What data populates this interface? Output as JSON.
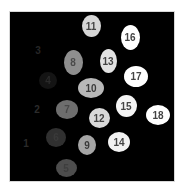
{
  "image": {
    "description": "Grayscale labeled segmentation image with 18 numbered objects on black background",
    "background": "#000000"
  },
  "objects": [
    {
      "id": "1",
      "label": "1",
      "cx": 26,
      "cy": 143,
      "w": 0,
      "h": 0,
      "fill": "#000000",
      "text_color": "#2a2a2a"
    },
    {
      "id": "2",
      "label": "2",
      "cx": 37,
      "cy": 109,
      "w": 0,
      "h": 0,
      "fill": "#000000",
      "text_color": "#2c2c2c"
    },
    {
      "id": "3",
      "label": "3",
      "cx": 38,
      "cy": 50,
      "w": 0,
      "h": 0,
      "fill": "#000000",
      "text_color": "#262626"
    },
    {
      "id": "4",
      "label": "4",
      "cx": 48,
      "cy": 80,
      "w": 18,
      "h": 17,
      "fill": "#141414",
      "text_color": "#2a2a2a"
    },
    {
      "id": "5",
      "label": "5",
      "cx": 66,
      "cy": 168,
      "w": 21,
      "h": 18,
      "fill": "#4d4d4d",
      "text_color": "#3e3e3e"
    },
    {
      "id": "6",
      "label": "6",
      "cx": 56,
      "cy": 137,
      "w": 20,
      "h": 19,
      "fill": "#303030",
      "text_color": "#3a3a3a"
    },
    {
      "id": "7",
      "label": "7",
      "cx": 67,
      "cy": 109,
      "w": 22,
      "h": 19,
      "fill": "#6e6e6e",
      "text_color": "#4a4a4a"
    },
    {
      "id": "8",
      "label": "8",
      "cx": 73,
      "cy": 62,
      "w": 19,
      "h": 25,
      "fill": "#8e8e8e",
      "text_color": "#4a4a4a"
    },
    {
      "id": "9",
      "label": "9",
      "cx": 87,
      "cy": 145,
      "w": 18,
      "h": 20,
      "fill": "#a5a5a5",
      "text_color": "#3a3a3a"
    },
    {
      "id": "10",
      "label": "10",
      "cx": 91,
      "cy": 88,
      "w": 26,
      "h": 20,
      "fill": "#b8b8b8",
      "text_color": "#3a3a3a"
    },
    {
      "id": "11",
      "label": "11",
      "cx": 91,
      "cy": 26,
      "w": 19,
      "h": 22,
      "fill": "#d6d6d6",
      "text_color": "#444444"
    },
    {
      "id": "12",
      "label": "12",
      "cx": 99,
      "cy": 118,
      "w": 21,
      "h": 20,
      "fill": "#d9d9d9",
      "text_color": "#444444"
    },
    {
      "id": "13",
      "label": "13",
      "cx": 108,
      "cy": 61,
      "w": 17,
      "h": 24,
      "fill": "#e2e2e2",
      "text_color": "#444444"
    },
    {
      "id": "14",
      "label": "14",
      "cx": 119,
      "cy": 142,
      "w": 22,
      "h": 20,
      "fill": "#f2f2f2",
      "text_color": "#444444"
    },
    {
      "id": "15",
      "label": "15",
      "cx": 126,
      "cy": 106,
      "w": 21,
      "h": 22,
      "fill": "#f4f4f4",
      "text_color": "#444444"
    },
    {
      "id": "16",
      "label": "16",
      "cx": 130,
      "cy": 37,
      "w": 19,
      "h": 25,
      "fill": "#ffffff",
      "text_color": "#444444"
    },
    {
      "id": "17",
      "label": "17",
      "cx": 136,
      "cy": 76,
      "w": 24,
      "h": 21,
      "fill": "#ffffff",
      "text_color": "#444444"
    },
    {
      "id": "18",
      "label": "18",
      "cx": 158,
      "cy": 115,
      "w": 24,
      "h": 20,
      "fill": "#ffffff",
      "text_color": "#444444"
    }
  ]
}
